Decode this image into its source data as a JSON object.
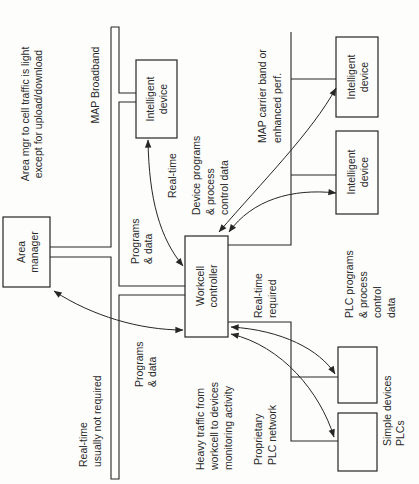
{
  "nodes": {
    "area_manager": [
      "Area",
      "manager"
    ],
    "intelligent_device_broadband": [
      "Intelligent",
      "device"
    ],
    "workcell_controller": [
      "Workcell",
      "controller"
    ],
    "intelligent_device_carrier_upper": [
      "Intelligent",
      "device"
    ],
    "intelligent_device_carrier_lower": [
      "Intelligent",
      "device"
    ],
    "simple_device_upper": [],
    "simple_device_lower": []
  },
  "networks": {
    "map_broadband": [
      "MAP Broadband"
    ],
    "map_carrier_band": [
      "MAP carrier band or",
      "enhanced perf."
    ],
    "plc_network": [
      "Proprietary",
      "PLC network"
    ]
  },
  "annotations": {
    "area_mgr_traffic": [
      "Area mgr to cell traffic is light",
      "except for upload/download"
    ],
    "broadband_device_programs": [
      "Programs",
      "& data"
    ],
    "broadband_device_realtime": [
      "Real-time"
    ],
    "device_programs": [
      "Device programs",
      "& process",
      "control data"
    ],
    "area_mgr_programs": [
      "Programs",
      "& data"
    ],
    "realtime_not_required": [
      "Real-time",
      "usually not required"
    ],
    "heavy_traffic": [
      "Heavy traffic from",
      "workcell to devices",
      "monitoring activity"
    ],
    "realtime_required": [
      "Real-time",
      "required"
    ],
    "plc_programs": [
      "PLC programs",
      "& process",
      "control",
      "data"
    ],
    "simple_devices": [
      "Simple devices",
      "PLCs"
    ]
  },
  "connections": [
    {
      "from": "area_manager",
      "to": "workcell_controller",
      "direction": "bidirectional",
      "via": "map_broadband"
    },
    {
      "from": "intelligent_device_broadband",
      "to": "workcell_controller",
      "direction": "bidirectional",
      "via": "map_broadband"
    },
    {
      "from": "workcell_controller",
      "to": "intelligent_device_carrier_upper",
      "direction": "bidirectional",
      "via": "map_carrier_band"
    },
    {
      "from": "workcell_controller",
      "to": "intelligent_device_carrier_lower",
      "direction": "bidirectional",
      "via": "map_carrier_band"
    },
    {
      "from": "workcell_controller",
      "to": "simple_device_upper",
      "direction": "bidirectional",
      "via": "plc_network"
    },
    {
      "from": "workcell_controller",
      "to": "simple_device_lower",
      "direction": "bidirectional",
      "via": "plc_network"
    }
  ],
  "colors": {
    "line": "#262626",
    "text": "#2a2a2a",
    "background": "#fdfdfc"
  }
}
